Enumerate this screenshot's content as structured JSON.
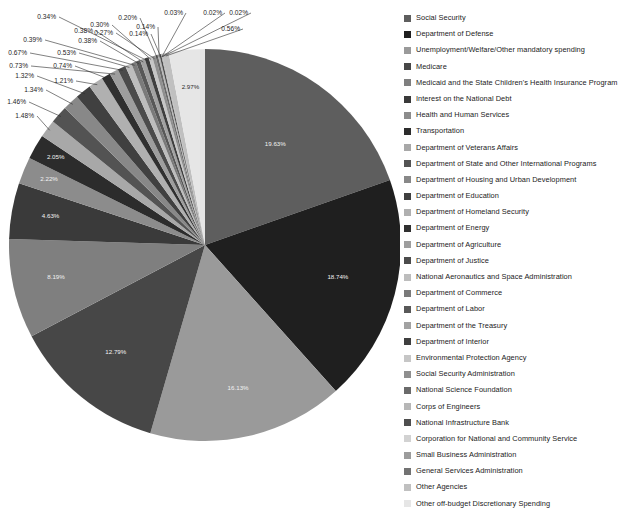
{
  "chart_data": {
    "type": "pie",
    "title": "",
    "legend_position": "right",
    "labels_shown_as": "percent",
    "categories": [
      "Social Security",
      "Department of Defense",
      "Unemployment/Welfare/Other mandatory spending",
      "Medicare",
      "Medicaid and the State Children's Health Insurance Program",
      "Interest on the National Debt",
      "Health and Human Services",
      "Transportation",
      "Department of Veterans Affairs",
      "Department of State and Other International Programs",
      "Department of Housing and Urban Development",
      "Department of Education",
      "Department of Homeland Security",
      "Department of Energy",
      "Department of Agriculture",
      "Department of Justice",
      "National Aeronautics and Space Administration",
      "Department of Commerce",
      "Department of Labor",
      "Department of the Treasury",
      "Department of Interior",
      "Environmental Protection Agency",
      "Social Security Administration",
      "National Science Foundation",
      "Corps of Engineers",
      "National Infrastructure Bank",
      "Corporation for National and Community Service",
      "Small Business Administration",
      "General Services Administration",
      "Other Agencies",
      "Other off-budget Discretionary Spending"
    ],
    "values": [
      19.63,
      18.74,
      16.13,
      12.79,
      8.19,
      4.63,
      2.22,
      2.05,
      1.48,
      1.46,
      1.34,
      1.32,
      1.21,
      0.74,
      0.73,
      0.67,
      0.53,
      0.39,
      0.38,
      0.38,
      0.34,
      0.3,
      0.27,
      0.2,
      0.14,
      0.14,
      0.03,
      0.02,
      0.02,
      0.56,
      2.97
    ],
    "value_labels": [
      "19.63%",
      "18.74%",
      "16.13%",
      "12.79%",
      "8.19%",
      "4.63%",
      "2.22%",
      "2.05%",
      "1.48%",
      "1.46%",
      "1.34%",
      "1.32%",
      "1.21%",
      "0.74%",
      "0.73%",
      "0.67%",
      "0.53%",
      "0.39%",
      "0.38%",
      "0.38%",
      "0.34%",
      "0.30%",
      "0.27%",
      "0.20%",
      "0.14%",
      "0.14%",
      "0.03%",
      "0.02%",
      "0.02%",
      "0.56%",
      "2.97%"
    ],
    "colors": [
      "#5e5e5e",
      "#1f1f1f",
      "#9a9a9a",
      "#474747",
      "#7f7f7f",
      "#3a3a3a",
      "#8c8c8c",
      "#2c2c2c",
      "#a8a8a8",
      "#535353",
      "#888888",
      "#404040",
      "#b0b0b0",
      "#303030",
      "#9e9e9e",
      "#4b4b4b",
      "#bdbdbd",
      "#7a7a7a",
      "#585858",
      "#a2a2a2",
      "#3f3f3f",
      "#c6c6c6",
      "#8f8f8f",
      "#6a6a6a",
      "#b7b7b7",
      "#4e4e4e",
      "#d2d2d2",
      "#9c9c9c",
      "#727272",
      "#c0c0c0",
      "#e6e6e6"
    ],
    "legend": [
      {
        "label": "Social Security",
        "color": "#5e5e5e"
      },
      {
        "label": "Department of Defense",
        "color": "#1f1f1f"
      },
      {
        "label": "Unemployment/Welfare/Other mandatory spending",
        "color": "#9a9a9a"
      },
      {
        "label": "Medicare",
        "color": "#474747"
      },
      {
        "label": "Medicaid and the State Children's Health Insurance Program",
        "color": "#7f7f7f"
      },
      {
        "label": "Interest on the National Debt",
        "color": "#3a3a3a"
      },
      {
        "label": "Health and Human Services",
        "color": "#8c8c8c"
      },
      {
        "label": "Transportation",
        "color": "#2c2c2c"
      },
      {
        "label": "Department of Veterans Affairs",
        "color": "#a8a8a8"
      },
      {
        "label": "Department of State and Other International Programs",
        "color": "#535353"
      },
      {
        "label": "Department of Housing and Urban Development",
        "color": "#888888"
      },
      {
        "label": "Department of Education",
        "color": "#404040"
      },
      {
        "label": "Department of Homeland Security",
        "color": "#b0b0b0"
      },
      {
        "label": "Department of Energy",
        "color": "#303030"
      },
      {
        "label": "Department of Agriculture",
        "color": "#9e9e9e"
      },
      {
        "label": "Department of Justice",
        "color": "#4b4b4b"
      },
      {
        "label": "National Aeronautics and Space Administration",
        "color": "#bdbdbd"
      },
      {
        "label": "Department of Commerce",
        "color": "#7a7a7a"
      },
      {
        "label": "Department of Labor",
        "color": "#585858"
      },
      {
        "label": "Department of the Treasury",
        "color": "#a2a2a2"
      },
      {
        "label": "Department of Interior",
        "color": "#3f3f3f"
      },
      {
        "label": "Environmental Protection Agency",
        "color": "#c6c6c6"
      },
      {
        "label": "Social Security Administration",
        "color": "#8f8f8f"
      },
      {
        "label": "National Science Foundation",
        "color": "#6a6a6a"
      },
      {
        "label": "Corps of Engineers",
        "color": "#b7b7b7"
      },
      {
        "label": "National Infrastructure Bank",
        "color": "#4e4e4e"
      },
      {
        "label": "Corporation for National and Community Service",
        "color": "#d2d2d2"
      },
      {
        "label": "Small Business Administration",
        "color": "#9c9c9c"
      },
      {
        "label": "General Services Administration",
        "color": "#727272"
      },
      {
        "label": "Other Agencies",
        "color": "#c0c0c0"
      },
      {
        "label": "Other off-budget Discretionary Spending",
        "color": "#e6e6e6"
      }
    ],
    "geometry": {
      "center_x": 205,
      "center_y": 245,
      "radius": 196,
      "start_angle_deg": 0,
      "direction": "clockwise",
      "inside_label_count": 8
    }
  }
}
